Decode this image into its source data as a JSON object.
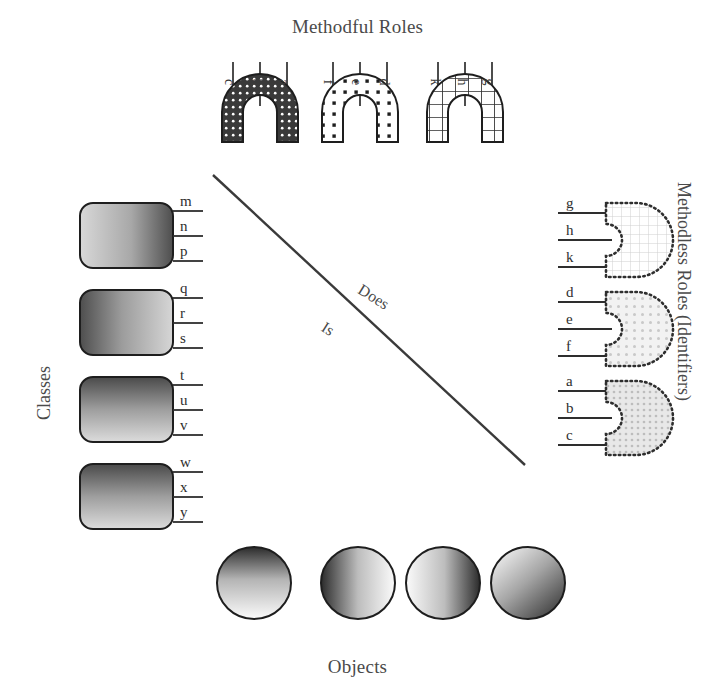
{
  "diagram": {
    "titles": {
      "methodful": "Methodful Roles",
      "objects": "Objects",
      "classes": "Classes",
      "methodless": "Methodless Roles (Identifiers)"
    },
    "relations": {
      "does": "Does",
      "is": "Is"
    },
    "methodful_roles": [
      {
        "name": "arch-dark-dotted",
        "fill": "#3a3a3a",
        "pattern": "white-dots",
        "legs": [
          "c",
          "b",
          "a"
        ]
      },
      {
        "name": "arch-light-dotted",
        "fill": "#ffffff",
        "pattern": "black-dots",
        "legs": [
          "f",
          "e",
          "d"
        ]
      },
      {
        "name": "arch-grid",
        "fill": "#ffffff",
        "pattern": "black-grid",
        "legs": [
          "k",
          "h",
          "g"
        ]
      }
    ],
    "methodless_roles": [
      {
        "name": "socket-grid",
        "legs": [
          "g",
          "h",
          "k"
        ],
        "pattern": "faint-grid"
      },
      {
        "name": "socket-dots",
        "legs": [
          "d",
          "e",
          "f"
        ],
        "pattern": "faint-dots"
      },
      {
        "name": "socket-dense",
        "legs": [
          "a",
          "b",
          "c"
        ],
        "pattern": "dense-dots"
      }
    ],
    "classes": [
      {
        "name": "class-box-1",
        "gradient": "left-light-right-dark",
        "roles": [
          "m",
          "n",
          "p"
        ]
      },
      {
        "name": "class-box-2",
        "gradient": "left-dark-right-light",
        "roles": [
          "q",
          "r",
          "s"
        ]
      },
      {
        "name": "class-box-3",
        "gradient": "top-dark-bottom-light",
        "roles": [
          "t",
          "u",
          "v"
        ]
      },
      {
        "name": "class-box-4",
        "gradient": "top-dark-bottom-light",
        "roles": [
          "w",
          "x",
          "y"
        ]
      }
    ],
    "objects": [
      {
        "name": "object-1",
        "gradient": "top-dark-bottom-light"
      },
      {
        "name": "object-2",
        "gradient": "left-dark-right-light"
      },
      {
        "name": "object-3",
        "gradient": "left-light-right-dark"
      },
      {
        "name": "object-4",
        "gradient": "diagonal-light-to-dark"
      }
    ],
    "colors": {
      "ink": "#2e2e2e",
      "text": "#4a4a4a",
      "dark_fill": "#3a3a3a",
      "light_fill": "#ffffff"
    }
  }
}
